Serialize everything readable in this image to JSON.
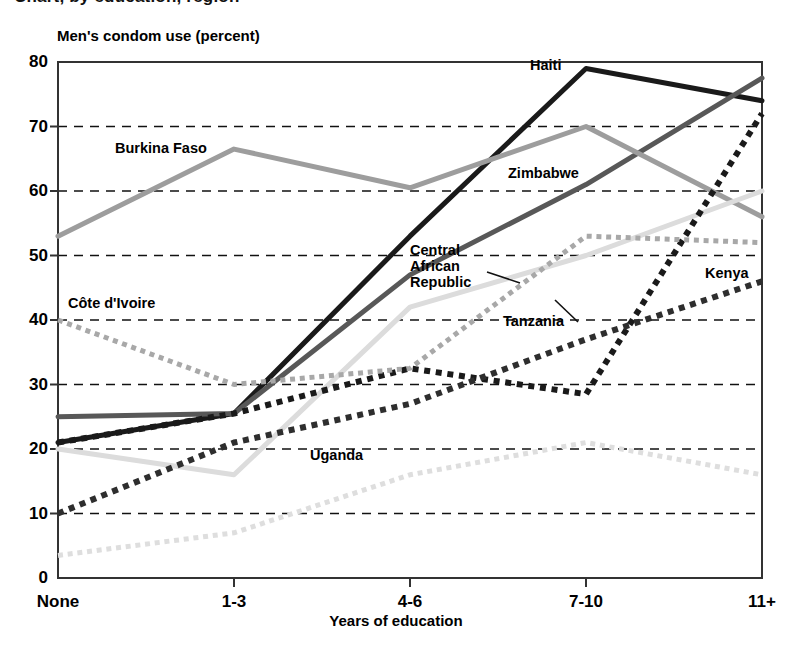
{
  "clipped_heading": "Chart, by education, region",
  "axis": {
    "y_title": "Men's condom use (percent)",
    "x_title": "Years of education",
    "y_ticks": [
      "0",
      "10",
      "20",
      "30",
      "40",
      "50",
      "60",
      "70",
      "80"
    ],
    "x_ticks": [
      "None",
      "1-3",
      "4-6",
      "7-10",
      "11+"
    ]
  },
  "chart_data": {
    "type": "line",
    "title": "Men's condom use (percent)",
    "xlabel": "Years of education",
    "ylabel": "Men's condom use (percent)",
    "categories": [
      "None",
      "1-3",
      "4-6",
      "7-10",
      "11+"
    ],
    "ylim": [
      0,
      80
    ],
    "ytick_step": 10,
    "grid": "horizontal-dashed",
    "legend": "inline-labels",
    "series": [
      {
        "name": "Haiti",
        "values": [
          21,
          25.5,
          53,
          79,
          74
        ],
        "color": "#1a1a1a",
        "style": "solid",
        "width": 5
      },
      {
        "name": "Zimbabwe",
        "values": [
          25,
          25.5,
          47,
          61,
          77.5
        ],
        "color": "#585858",
        "style": "solid",
        "width": 5
      },
      {
        "name": "Burkina Faso",
        "values": [
          53,
          66.5,
          60.5,
          70,
          56
        ],
        "color": "#9d9d9d",
        "style": "solid",
        "width": 5
      },
      {
        "name": "Central African Republic",
        "values": [
          20,
          16,
          42,
          50,
          60
        ],
        "color": "#dcdcdc",
        "style": "solid",
        "width": 5
      },
      {
        "name": "Tanzania",
        "values": [
          21,
          25.5,
          32.5,
          28.5,
          72
        ],
        "color": "#1a1a1a",
        "style": "dotted",
        "width": 6
      },
      {
        "name": "Kenya",
        "values": [
          10,
          21,
          27,
          37,
          46
        ],
        "color": "#2e2e2e",
        "style": "dotted",
        "width": 6
      },
      {
        "name": "Côte d'Ivoire",
        "values": [
          40,
          30,
          32.5,
          53,
          52
        ],
        "color": "#a8a8a8",
        "style": "dotted",
        "width": 5
      },
      {
        "name": "Uganda",
        "values": [
          3.5,
          7,
          16,
          21,
          16
        ],
        "color": "#dedede",
        "style": "dotted",
        "width": 5
      }
    ]
  },
  "series_labels": [
    {
      "name": "Burkina Faso",
      "text": "Burkina Faso",
      "x": 115,
      "y": 140
    },
    {
      "name": "Côte d'Ivoire",
      "text": "Côte d'Ivoire",
      "x": 68,
      "y": 295
    },
    {
      "name": "Haiti",
      "text": "Haiti",
      "x": 530,
      "y": 57
    },
    {
      "name": "Zimbabwe",
      "text": "Zimbabwe",
      "x": 508,
      "y": 165
    },
    {
      "name": "Central African Republic",
      "text": "Central African Republic",
      "x": 410,
      "y": 242
    },
    {
      "name": "Tanzania",
      "text": "Tanzania",
      "x": 503,
      "y": 313
    },
    {
      "name": "Kenya",
      "text": "Kenya",
      "x": 705,
      "y": 265
    },
    {
      "name": "Uganda",
      "text": "Uganda",
      "x": 310,
      "y": 447
    }
  ]
}
